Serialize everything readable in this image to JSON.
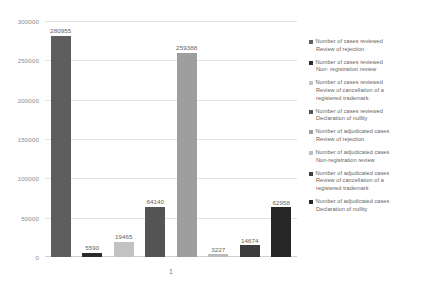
{
  "chart_data": {
    "type": "bar",
    "title": "",
    "xlabel": "",
    "ylabel": "",
    "categories": [
      "1"
    ],
    "ylim": [
      0,
      300000
    ],
    "y_ticks": [
      "0",
      "50000",
      "100000",
      "150000",
      "200000",
      "250000",
      "300000"
    ],
    "y_tick_values": [
      0,
      50000,
      100000,
      150000,
      200000,
      250000,
      300000
    ],
    "grid": true,
    "legend_position": "right",
    "series": [
      {
        "name": "Number of cases reviewed Review of rejection",
        "name_line1": "Number of cases reviewed",
        "name_line2": "Review of rejection",
        "values": [
          280955
        ],
        "label": "280955",
        "color": "#5e5e5e"
      },
      {
        "name": "Number of cases reviewed Non-registration review",
        "name_line1": "Number of cases reviewed",
        "name_line2": "Non- registration review",
        "values": [
          5590
        ],
        "label": "5590",
        "color": "#2b2b2b"
      },
      {
        "name": "Number of cases reviewed Review of cancellation of a registered trademark",
        "name_line1": "Number of cases reviewed",
        "name_line2": "Review of cancellation of a",
        "name_line3": "registered trademark",
        "values": [
          19465
        ],
        "label": "19465",
        "color": "#c2c2c2"
      },
      {
        "name": "Number of cases reviewed Declaration of nullity",
        "name_line1": "Number of cases reviewed",
        "name_line2": "Declaration of nullity",
        "values": [
          64140
        ],
        "label": "64140",
        "color": "#545454"
      },
      {
        "name": "Number of adjudicated cases Review of rejection",
        "name_line1": "Number of adjudicated cases",
        "name_line2": "Review of rejection",
        "values": [
          259388
        ],
        "label": "259388",
        "color": "#9e9e9e"
      },
      {
        "name": "Number of adjudicated cases Non-registration review",
        "name_line1": "Number of adjudicated cases",
        "name_line2": "Non-registration review",
        "values": [
          3227
        ],
        "label": "3227",
        "color": "#bdbdbd"
      },
      {
        "name": "Number of adjudicated cases Review of cancellation of a registered trademark",
        "name_line1": "Number of adjudicated cases",
        "name_line2": "Review of cancellation of a",
        "name_line3": "registered trademark",
        "values": [
          14674
        ],
        "label": "14674",
        "color": "#3d3d3d"
      },
      {
        "name": "Number of adjudicated cases Declaration of nullity",
        "name_line1": "Number of adjudicated cases",
        "name_line2": "Declaration of nullity",
        "values": [
          62958
        ],
        "label": "62958",
        "color": "#262626"
      }
    ]
  }
}
